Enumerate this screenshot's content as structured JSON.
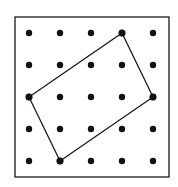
{
  "diagram": {
    "type": "dot-lattice-with-polygon",
    "grid": {
      "columns": 5,
      "rows": 5
    },
    "polygon": {
      "shape": "rectangle",
      "vertices": [
        {
          "col": 3,
          "row": 0
        },
        {
          "col": 4,
          "row": 2
        },
        {
          "col": 1,
          "row": 4
        },
        {
          "col": 0,
          "row": 2
        }
      ]
    },
    "colors": {
      "background": "#ffffff",
      "border": "#1a1a1a",
      "dot": "#111111",
      "line": "#1a1a1a"
    }
  }
}
